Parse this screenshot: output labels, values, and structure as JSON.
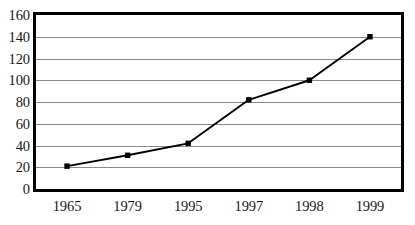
{
  "chart_data": {
    "type": "line",
    "title": "",
    "subtitle": "",
    "xlabel": "",
    "ylabel": "",
    "categories": [
      "1965",
      "1979",
      "1995",
      "1997",
      "1998",
      "1999"
    ],
    "values": [
      21,
      31,
      42,
      82,
      100,
      140
    ],
    "series": [
      {
        "name": "",
        "values": [
          21,
          31,
          42,
          82,
          100,
          140
        ]
      }
    ],
    "ylim": [
      0,
      160
    ],
    "yticks": [
      0,
      20,
      40,
      60,
      80,
      100,
      120,
      140,
      160
    ],
    "ytick_labels": [
      "0",
      "20",
      "40",
      "60",
      "80",
      "100",
      "120",
      "140",
      "160"
    ],
    "grid": "horizontal",
    "legend": "none",
    "marker": "square",
    "line_color": "#000000",
    "marker_color": "#000000",
    "gridline_color": "#8a8a8a",
    "frame_color": "#000000",
    "background_color": "#ffffff"
  },
  "figure": {
    "clipped_top_text": "",
    "plot_area": {
      "x": 33,
      "y": 12,
      "width": 371,
      "height": 180
    }
  }
}
